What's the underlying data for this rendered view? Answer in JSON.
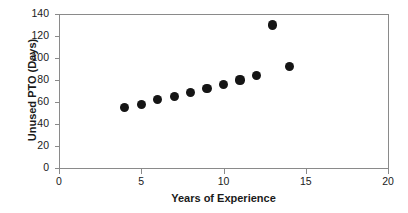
{
  "chart_data": {
    "type": "scatter",
    "title": "",
    "xlabel": "Years of Experience",
    "ylabel": "Unused PTO (Days)",
    "xlim": [
      0,
      20
    ],
    "ylim": [
      0,
      140
    ],
    "xticks": [
      "0",
      "5",
      "10",
      "15",
      "20"
    ],
    "xtick_values": [
      0,
      5,
      10,
      15,
      20
    ],
    "yticks": [
      "0",
      "20",
      "40",
      "60",
      "80",
      "100",
      "120",
      "140"
    ],
    "ytick_values": [
      0,
      20,
      40,
      60,
      80,
      100,
      120,
      140
    ],
    "grid": false,
    "legend": false,
    "marker": "filled-circle",
    "marker_color": "#151515",
    "axis_color": "#8a8a8a",
    "background_color": "#ffffff",
    "x": [
      4,
      5,
      6,
      7,
      8,
      9,
      10,
      11,
      12,
      13,
      14
    ],
    "y": [
      55,
      58,
      62,
      65,
      69,
      72,
      76,
      80,
      84,
      130,
      92
    ],
    "points": [
      {
        "x": 4,
        "y": 55
      },
      {
        "x": 5,
        "y": 58
      },
      {
        "x": 6,
        "y": 62
      },
      {
        "x": 7,
        "y": 65
      },
      {
        "x": 8,
        "y": 69
      },
      {
        "x": 9,
        "y": 72
      },
      {
        "x": 10,
        "y": 76
      },
      {
        "x": 11,
        "y": 80
      },
      {
        "x": 12,
        "y": 84
      },
      {
        "x": 13,
        "y": 130
      },
      {
        "x": 14,
        "y": 92
      }
    ]
  }
}
